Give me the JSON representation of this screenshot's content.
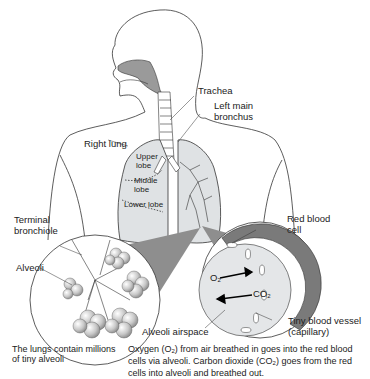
{
  "diagram": {
    "labels": {
      "trachea": "Trachea",
      "left_main_bronchus_1": "Left main",
      "left_main_bronchus_2": "bronchus",
      "right_lung": "Right lung",
      "upper_lobe_1": "Upper",
      "upper_lobe_2": "lobe",
      "middle_lobe_1": "Middle",
      "middle_lobe_2": "lobe",
      "lower_lobe": "Lower lobe",
      "terminal_bronchiole_1": "Terminal",
      "terminal_bronchiole_2": "bronchiole",
      "alveoli": "Alveoli",
      "red_blood_cell_1": "Red blood",
      "red_blood_cell_2": "cell",
      "o2": "O",
      "o2_sub": "2",
      "co2": "CO",
      "co2_sub": "2",
      "alveoli_airspace": "Alveoli airspace",
      "tiny_blood_vessel_1": "Tiny blood vessel",
      "tiny_blood_vessel_2": "(capillary)"
    },
    "captions": {
      "left_1": "The lungs contain millions",
      "left_2": "of tiny alveoli",
      "right_1a": "Oxygen (O",
      "right_1b": "2",
      "right_1c": ") from air breathed in goes into the red blood",
      "right_2a": "cells via alveoli. Carbon dioxide (CO",
      "right_2b": "2",
      "right_2c": ") goes from the red",
      "right_3": "cells into alveoli and breathed out."
    },
    "colors": {
      "line": "#333333",
      "lung_fill": "#dfe2e4",
      "airway_fill": "#9a9a9a",
      "cone_fill": "#8e8e8e",
      "capillary_fill": "#7a7a7a",
      "airspace_fill": "#e4e6e8"
    }
  }
}
